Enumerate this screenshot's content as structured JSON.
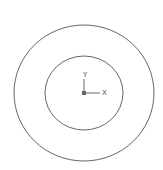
{
  "canvas": {
    "width": 163,
    "height": 170,
    "background": "#ffffff",
    "stroke": "#555555"
  },
  "outer_circle": {
    "cx": 84,
    "cy": 93,
    "rx": 70,
    "ry": 68
  },
  "inner_circle": {
    "cx": 84,
    "cy": 93,
    "rx": 39,
    "ry": 37
  },
  "axes": {
    "origin": {
      "x": 84,
      "y": 93
    },
    "x_label": "X",
    "y_label": "Y"
  }
}
